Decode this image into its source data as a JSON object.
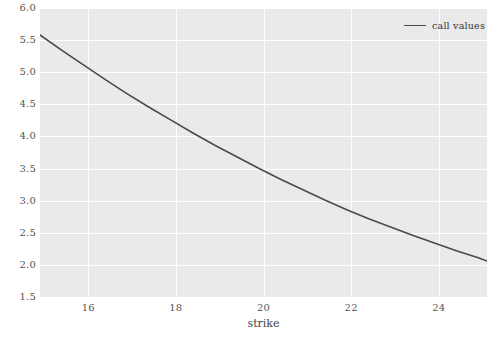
{
  "chart_data": {
    "type": "line",
    "title": "",
    "subtitle": "",
    "xlabel": "strike",
    "ylabel": "",
    "xlim": [
      14.9,
      25.1
    ],
    "ylim": [
      1.5,
      6.0
    ],
    "grid": true,
    "legend_position": "top-right",
    "xticks": [
      16,
      18,
      20,
      22,
      24
    ],
    "xtick_labels": [
      "16",
      "18",
      "20",
      "22",
      "24"
    ],
    "yticks": [
      1.5,
      2.0,
      2.5,
      3.0,
      3.5,
      4.0,
      4.5,
      5.0,
      5.5,
      6.0
    ],
    "ytick_labels": [
      "1.5",
      "2.0",
      "2.5",
      "3.0",
      "3.5",
      "4.0",
      "4.5",
      "5.0",
      "5.5",
      "6.0"
    ],
    "series": [
      {
        "name": "call values",
        "color": "#4a4a4a",
        "x": [
          14.9,
          15.4,
          15.9,
          16.4,
          16.9,
          17.4,
          17.9,
          18.4,
          18.9,
          19.4,
          19.9,
          20.4,
          20.9,
          21.4,
          21.9,
          22.4,
          22.9,
          23.4,
          23.9,
          24.4,
          24.9,
          25.1
        ],
        "values": [
          5.58,
          5.34,
          5.11,
          4.88,
          4.66,
          4.45,
          4.25,
          4.05,
          3.86,
          3.68,
          3.5,
          3.33,
          3.17,
          3.01,
          2.86,
          2.72,
          2.59,
          2.46,
          2.34,
          2.22,
          2.11,
          2.06
        ]
      }
    ]
  },
  "legend": {
    "entries": [
      {
        "label": "call values",
        "color": "#4a4a4a"
      }
    ]
  },
  "axes": {
    "x_title": "strike"
  },
  "caption": {
    "text": ""
  },
  "colors": {
    "plot_background": "#eaeaea",
    "figure_background": "#ffffff",
    "gridline": "#ffffff",
    "tick_text": "#555555",
    "line": "#4a4a4a"
  }
}
